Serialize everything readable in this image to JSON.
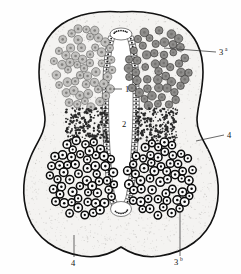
{
  "figure": {
    "caption": "",
    "background_color": "#ffffff",
    "outline_fill": "#f4f3f1",
    "outline_stroke": "#111111"
  },
  "labels": [
    {
      "id": "label-1",
      "name": "label-1-epithelium",
      "text": "1",
      "superscript": "",
      "x": 125,
      "y": 92,
      "leader": "dash-left"
    },
    {
      "id": "label-2",
      "name": "label-2-lumen",
      "text": "2",
      "superscript": "",
      "x": 122,
      "y": 127,
      "leader": "none"
    },
    {
      "id": "label-3a",
      "name": "label-3a-upper-cluster",
      "text": "3",
      "superscript": "a",
      "x": 221,
      "y": 54,
      "leader": "line-left"
    },
    {
      "id": "label-3b",
      "name": "label-3b-lower-cluster",
      "text": "3",
      "superscript": "b",
      "x": 179,
      "y": 263,
      "leader": "line-up"
    },
    {
      "id": "label-4-right",
      "name": "label-4-capsule-right",
      "text": "4",
      "superscript": "",
      "x": 228,
      "y": 137,
      "leader": "line-left"
    },
    {
      "id": "label-4-bottom",
      "name": "label-4-capsule-bottom",
      "text": "4",
      "superscript": "",
      "x": 73,
      "y": 264,
      "leader": "line-up"
    }
  ],
  "regions": {
    "outer_capsule": {
      "name": "outer-capsule",
      "shape": "peanut-figure-eight"
    },
    "central_lumen": {
      "name": "central-lumen",
      "fill": "#ffffff"
    },
    "epithelium": {
      "name": "columnar-epithelium-lining",
      "cell_color": "#ffffff",
      "nucleus_color": "#1a1a1a"
    },
    "upper_left_cluster": {
      "name": "upper-left-cell-cluster",
      "cell_color": "#c3c2c0",
      "cell_count": 96
    },
    "upper_right_cluster": {
      "name": "upper-right-cell-cluster",
      "cell_color": "#8e8d8b",
      "cell_count": 96
    },
    "lower_left_cluster": {
      "name": "lower-left-cell-cluster",
      "cell_color": "#0a0a0a",
      "cell_count": 120
    },
    "lower_right_cluster": {
      "name": "lower-right-cell-cluster",
      "cell_color": "#0a0a0a",
      "cell_count": 120
    },
    "transition_zones": {
      "name": "stippled-transition-zone",
      "stipple_color": "#2a2a2a"
    }
  }
}
